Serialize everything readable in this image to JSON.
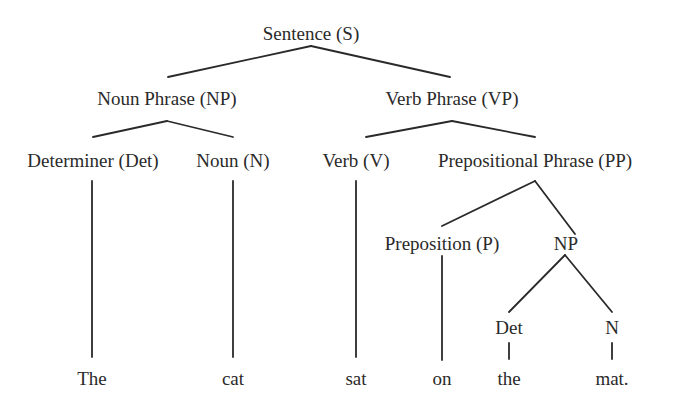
{
  "diagram": {
    "type": "parse-tree",
    "nodes": [
      {
        "id": "s",
        "label": "Sentence (S)",
        "x": 311,
        "y": 33
      },
      {
        "id": "np",
        "label": "Noun Phrase (NP)",
        "x": 167,
        "y": 98
      },
      {
        "id": "vp",
        "label": "Verb Phrase (VP)",
        "x": 452,
        "y": 98
      },
      {
        "id": "det",
        "label": "Determiner (Det)",
        "x": 93,
        "y": 160
      },
      {
        "id": "noun",
        "label": "Noun (N)",
        "x": 233,
        "y": 160
      },
      {
        "id": "verb",
        "label": "Verb (V)",
        "x": 356,
        "y": 160
      },
      {
        "id": "pp",
        "label": "Prepositional Phrase (PP)",
        "x": 535,
        "y": 160
      },
      {
        "id": "prep",
        "label": "Preposition (P)",
        "x": 442,
        "y": 243
      },
      {
        "id": "np2",
        "label": "NP",
        "x": 566,
        "y": 243
      },
      {
        "id": "det2",
        "label": "Det",
        "x": 509,
        "y": 327
      },
      {
        "id": "n2",
        "label": "N",
        "x": 612,
        "y": 327
      },
      {
        "id": "w_the",
        "label": "The",
        "x": 92,
        "y": 378
      },
      {
        "id": "w_cat",
        "label": "cat",
        "x": 233,
        "y": 378
      },
      {
        "id": "w_sat",
        "label": "sat",
        "x": 356,
        "y": 378
      },
      {
        "id": "w_on",
        "label": "on",
        "x": 442,
        "y": 378
      },
      {
        "id": "w_the2",
        "label": "the",
        "x": 509,
        "y": 378
      },
      {
        "id": "w_mat",
        "label": "mat.",
        "x": 612,
        "y": 378
      }
    ],
    "edges": [
      {
        "from": "s",
        "to": "np",
        "x1": 311,
        "y1": 46,
        "x2": 168,
        "y2": 77
      },
      {
        "from": "s",
        "to": "vp",
        "x1": 311,
        "y1": 46,
        "x2": 450,
        "y2": 77
      },
      {
        "from": "np",
        "to": "det",
        "x1": 167,
        "y1": 121,
        "x2": 93,
        "y2": 137
      },
      {
        "from": "np",
        "to": "noun",
        "x1": 167,
        "y1": 121,
        "x2": 233,
        "y2": 137
      },
      {
        "from": "vp",
        "to": "verb",
        "x1": 452,
        "y1": 121,
        "x2": 366,
        "y2": 137
      },
      {
        "from": "vp",
        "to": "pp",
        "x1": 452,
        "y1": 121,
        "x2": 535,
        "y2": 137
      },
      {
        "from": "det",
        "to": "w_the",
        "x1": 92,
        "y1": 181,
        "x2": 92,
        "y2": 357
      },
      {
        "from": "noun",
        "to": "w_cat",
        "x1": 233,
        "y1": 181,
        "x2": 233,
        "y2": 357
      },
      {
        "from": "verb",
        "to": "w_sat",
        "x1": 356,
        "y1": 181,
        "x2": 356,
        "y2": 357
      },
      {
        "from": "pp",
        "to": "prep",
        "x1": 535,
        "y1": 181,
        "x2": 442,
        "y2": 226
      },
      {
        "from": "pp",
        "to": "np2",
        "x1": 535,
        "y1": 181,
        "x2": 575,
        "y2": 234
      },
      {
        "from": "prep",
        "to": "w_on",
        "x1": 442,
        "y1": 256,
        "x2": 442,
        "y2": 360
      },
      {
        "from": "np2",
        "to": "det2",
        "x1": 565,
        "y1": 255,
        "x2": 509,
        "y2": 312
      },
      {
        "from": "np2",
        "to": "n2",
        "x1": 565,
        "y1": 255,
        "x2": 612,
        "y2": 312
      },
      {
        "from": "det2",
        "to": "w_the2",
        "x1": 509,
        "y1": 343,
        "x2": 509,
        "y2": 359
      },
      {
        "from": "n2",
        "to": "w_mat",
        "x1": 612,
        "y1": 343,
        "x2": 612,
        "y2": 359
      }
    ],
    "colors": {
      "line": "#2a2a2a",
      "text": "#2a2a2a",
      "background": "#ffffff"
    }
  }
}
